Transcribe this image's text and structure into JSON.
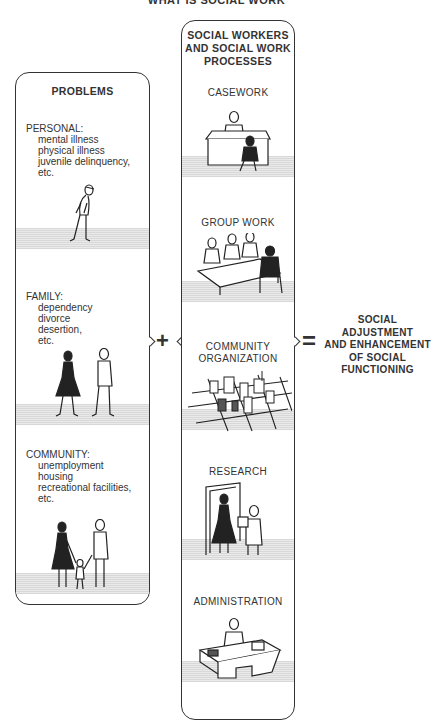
{
  "title": "WHAT IS SOCIAL WORK",
  "problems": {
    "heading": "PROBLEMS",
    "categories": [
      {
        "name": "PERSONAL:",
        "items": [
          "mental illness",
          "physical illness",
          "juvenile delinquency,",
          "etc."
        ],
        "figure": "walking-man-illustration"
      },
      {
        "name": "FAMILY:",
        "items": [
          "dependency",
          "divorce",
          "desertion,",
          "etc."
        ],
        "figure": "couple-walking-apart-illustration"
      },
      {
        "name": "COMMUNITY:",
        "items": [
          "unemployment",
          "housing",
          "recreational facilities,",
          "etc."
        ],
        "figure": "family-with-child-illustration"
      }
    ]
  },
  "processes": {
    "heading_lines": [
      "SOCIAL WORKERS",
      "AND SOCIAL WORK",
      "PROCESSES"
    ],
    "items": [
      {
        "label": "CASEWORK",
        "figure": "caseworker-at-desk-illustration"
      },
      {
        "label": "GROUP WORK",
        "figure": "group-at-table-illustration"
      },
      {
        "label_lines": [
          "COMMUNITY",
          "ORGANIZATION"
        ],
        "figure": "city-grid-illustration"
      },
      {
        "label": "RESEARCH",
        "figure": "researcher-at-door-illustration"
      },
      {
        "label": "ADMINISTRATION",
        "figure": "administrator-at-desk-illustration"
      }
    ]
  },
  "operators": {
    "plus": "+",
    "equals": "="
  },
  "result": {
    "lines": [
      "SOCIAL ADJUSTMENT",
      "AND ENHANCEMENT",
      "OF SOCIAL",
      "FUNCTIONING"
    ]
  }
}
